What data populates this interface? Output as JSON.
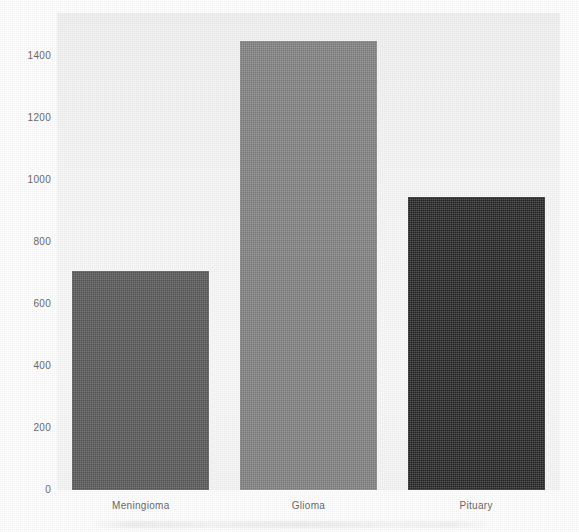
{
  "chart_data": {
    "type": "bar",
    "title": "",
    "subtitle": "",
    "xlabel": "",
    "ylabel": "",
    "categories": [
      "Meningioma",
      "Glioma",
      "Pituary"
    ],
    "values": [
      708,
      1450,
      945
    ],
    "series": [
      {
        "name": "Image count",
        "values": [
          708,
          1450,
          945
        ]
      }
    ],
    "bar_colors": [
      "#5e5e5e",
      "#8a8a8a",
      "#2b2b2b"
    ],
    "ylim": [
      0,
      1530
    ],
    "xlim_categories": 3,
    "ytick_labels": [
      "0",
      "200",
      "400",
      "600",
      "800",
      "1000",
      "1200",
      "1400"
    ],
    "ytick_values": [
      0,
      200,
      400,
      600,
      800,
      1000,
      1200,
      1400
    ],
    "xtick_labels": [
      "Meningioma",
      "Glioma",
      "Pituary"
    ],
    "grid": false,
    "legend": null,
    "legend_position": "none",
    "annotations": [],
    "plot_background_color": "#f7f7f7",
    "figure_background_color": "#ffffff",
    "axis_label_color": "#6b6b6b"
  },
  "bars": [
    {
      "label": "Meningioma",
      "value": 708,
      "color": "#5e5e5e"
    },
    {
      "label": "Glioma",
      "value": 1450,
      "color": "#8a8a8a"
    },
    {
      "label": "Pituary",
      "value": 945,
      "color": "#2b2b2b"
    }
  ],
  "yticks": [
    {
      "label": "1400",
      "value": 1400
    },
    {
      "label": "1200",
      "value": 1200
    },
    {
      "label": "1000",
      "value": 1000
    },
    {
      "label": "800",
      "value": 800
    },
    {
      "label": "600",
      "value": 600
    },
    {
      "label": "400",
      "value": 400
    },
    {
      "label": "200",
      "value": 200
    },
    {
      "label": "0",
      "value": 0
    }
  ]
}
